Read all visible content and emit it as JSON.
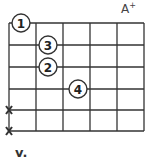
{
  "chord": {
    "name": "A",
    "quality": "+",
    "position_label": "v."
  },
  "grid": {
    "strings": 6,
    "frets": 5,
    "x": [
      9,
      36,
      63,
      90,
      117,
      144
    ],
    "y": [
      23,
      45,
      67,
      89,
      110,
      131
    ]
  },
  "fingers": [
    {
      "label": "1",
      "cx": 21,
      "cy": 23
    },
    {
      "label": "3",
      "cx": 48,
      "cy": 45
    },
    {
      "label": "2",
      "cx": 48,
      "cy": 67
    },
    {
      "label": "4",
      "cx": 78,
      "cy": 89
    }
  ],
  "muted": [
    {
      "symbol": "X",
      "cx": 9,
      "cy": 110
    },
    {
      "symbol": "X",
      "cx": 9,
      "cy": 131
    }
  ]
}
